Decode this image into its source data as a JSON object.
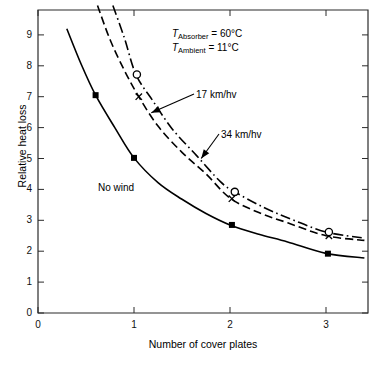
{
  "chart_data": {
    "type": "line",
    "title": "",
    "xlabel": "Number of cover plates",
    "ylabel": "Relative heat loss",
    "xlim": [
      0,
      3.45
    ],
    "ylim": [
      0,
      9.9
    ],
    "xticks": [
      "0",
      "1",
      "2",
      "3"
    ],
    "xtick_values": [
      0,
      1,
      2,
      3
    ],
    "yticks": [
      "0",
      "1",
      "2",
      "3",
      "4",
      "5",
      "6",
      "7",
      "8",
      "9"
    ],
    "ytick_values": [
      0,
      1,
      2,
      3,
      4,
      5,
      6,
      7,
      8,
      9
    ],
    "grid": false,
    "legend_position": "inline-annotations",
    "annotations": [
      {
        "name": "absorber-temperature",
        "symbol": "T",
        "subscript": "Absorber",
        "text": "= 60°C",
        "full": "T_Absorber = 60°C"
      },
      {
        "name": "ambient-temperature",
        "symbol": "T",
        "subscript": "Ambient",
        "text": "= 11°C",
        "full": "T_Ambient = 11°C"
      }
    ],
    "series": [
      {
        "name": "No wind",
        "label": "No wind",
        "linestyle": "solid",
        "marker": "filled-square",
        "color": "#000000",
        "x": [
          0.3,
          0.45,
          0.6,
          0.8,
          1.0,
          1.25,
          1.5,
          1.75,
          2.0,
          2.3,
          2.6,
          3.0,
          3.4
        ],
        "y": [
          9.2,
          8.05,
          7.05,
          6.0,
          5.02,
          4.22,
          3.68,
          3.22,
          2.85,
          2.55,
          2.3,
          1.93,
          1.78
        ],
        "markers": [
          {
            "x": 0.6,
            "y": 7.05
          },
          {
            "x": 1.0,
            "y": 5.02
          },
          {
            "x": 2.02,
            "y": 2.85
          },
          {
            "x": 3.02,
            "y": 1.92
          }
        ]
      },
      {
        "name": "17 km/hv",
        "label": "17 km/hv",
        "linestyle": "dashed",
        "marker": "cross",
        "color": "#000000",
        "x": [
          0.62,
          0.75,
          0.9,
          1.05,
          1.25,
          1.5,
          1.75,
          2.0,
          2.3,
          2.6,
          3.0,
          3.4
        ],
        "y": [
          9.95,
          8.85,
          7.85,
          7.0,
          6.05,
          5.2,
          4.5,
          3.72,
          3.25,
          2.92,
          2.5,
          2.35
        ],
        "markers": [
          {
            "x": 1.05,
            "y": 7.0
          },
          {
            "x": 2.02,
            "y": 3.7
          },
          {
            "x": 3.03,
            "y": 2.5
          }
        ]
      },
      {
        "name": "34 km/hv",
        "label": "34 km/hv",
        "linestyle": "dashdot",
        "marker": "open-circle",
        "color": "#000000",
        "x": [
          0.78,
          0.9,
          1.02,
          1.2,
          1.4,
          1.65,
          1.9,
          2.05,
          2.35,
          2.65,
          3.0,
          3.4
        ],
        "y": [
          9.95,
          8.9,
          7.72,
          6.85,
          5.95,
          5.1,
          4.25,
          3.92,
          3.42,
          3.02,
          2.62,
          2.42
        ],
        "markers": [
          {
            "x": 1.03,
            "y": 7.72
          },
          {
            "x": 2.05,
            "y": 3.92
          },
          {
            "x": 3.03,
            "y": 2.62
          }
        ]
      }
    ],
    "arrows": [
      {
        "name": "arrow-17",
        "from_label": "17 km/hv",
        "tip_x": 1.18,
        "tip_y": 6.48
      },
      {
        "name": "arrow-34",
        "from_label": "34 km/hv",
        "tip_x": 1.7,
        "tip_y": 5.0
      }
    ]
  }
}
